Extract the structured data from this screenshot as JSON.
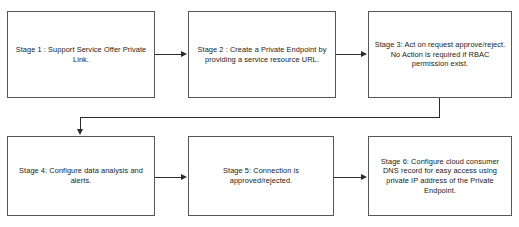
{
  "diagram": {
    "stroke_color": "#555759",
    "edge_color": "#2b2b2b",
    "background_color": "#ffffff",
    "nodes": [
      {
        "id": "stage-1",
        "label": "Stage 1 : Support Service Offer Private Link."
      },
      {
        "id": "stage-2",
        "label": "Stage 2 : Create a Private Endpoint by providing a service resource URL."
      },
      {
        "id": "stage-3",
        "label": "Stage 3: Act on request approve/reject. No Action is required if RBAC permission exist."
      },
      {
        "id": "stage-4",
        "label": "Stage 4: Configure data analysis and alerts."
      },
      {
        "id": "stage-5",
        "label": "Stage 5: Connection is approved/rejected."
      },
      {
        "id": "stage-6",
        "label": "Stage 6: Configure cloud consumer DNS record for easy access using private IP address of the Private Endpoint."
      }
    ],
    "edges": [
      {
        "id": "edge-1-2",
        "from": "stage-1",
        "to": "stage-2",
        "style": "straight-right"
      },
      {
        "id": "edge-2-3",
        "from": "stage-2",
        "to": "stage-3",
        "style": "straight-right"
      },
      {
        "id": "edge-3-4",
        "from": "stage-3",
        "to": "stage-4",
        "style": "elbow-down-left-down"
      },
      {
        "id": "edge-4-5",
        "from": "stage-4",
        "to": "stage-5",
        "style": "straight-right"
      },
      {
        "id": "edge-5-6",
        "from": "stage-5",
        "to": "stage-6",
        "style": "straight-right"
      }
    ]
  }
}
